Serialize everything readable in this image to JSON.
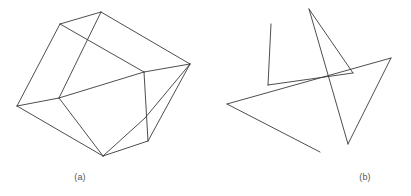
{
  "figure": {
    "background_color": "#ffffff",
    "stroke_color": "#3a3a3a",
    "caption_color": "#555555",
    "width": 411,
    "height": 196,
    "panels": [
      {
        "id": "a",
        "caption": "(a)",
        "description": "wireframe-box-open-cube",
        "origin_x": 0,
        "origin_y": 0,
        "vertices": {
          "outer_top": [
            101,
            12
          ],
          "outer_upper_left": [
            60,
            24
          ],
          "outer_left": [
            17,
            106
          ],
          "outer_bottom": [
            103,
            156
          ],
          "outer_lower_right": [
            148,
            141
          ],
          "outer_right": [
            190,
            64
          ],
          "inner_top_left": [
            58,
            43
          ],
          "inner_bottom_left": [
            59,
            98
          ],
          "inner_top_right": [
            144,
            72
          ],
          "inner_bottom_right": [
            145,
            118
          ]
        },
        "edges": [
          [
            [
              101,
              12
            ],
            [
              60,
              24
            ]
          ],
          [
            [
              60,
              24
            ],
            [
              17,
              106
            ]
          ],
          [
            [
              17,
              106
            ],
            [
              103,
              156
            ]
          ],
          [
            [
              103,
              156
            ],
            [
              148,
              141
            ]
          ],
          [
            [
              148,
              141
            ],
            [
              190,
              64
            ]
          ],
          [
            [
              190,
              64
            ],
            [
              101,
              12
            ]
          ],
          [
            [
              60,
              24
            ],
            [
              144,
              72
            ]
          ],
          [
            [
              101,
              12
            ],
            [
              59,
              98
            ]
          ],
          [
            [
              59,
              98
            ],
            [
              17,
              106
            ]
          ],
          [
            [
              59,
              98
            ],
            [
              103,
              156
            ]
          ],
          [
            [
              59,
              98
            ],
            [
              144,
              72
            ]
          ],
          [
            [
              144,
              72
            ],
            [
              190,
              64
            ]
          ],
          [
            [
              144,
              72
            ],
            [
              148,
              141
            ]
          ],
          [
            [
              103,
              156
            ],
            [
              145,
              118
            ]
          ],
          [
            [
              145,
              118
            ],
            [
              190,
              64
            ]
          ]
        ]
      },
      {
        "id": "b",
        "caption": "(b)",
        "description": "random-scattered-line-segments",
        "origin_x": 205,
        "origin_y": 0,
        "segments": [
          {
            "name": "vertical-left-stroke",
            "points": [
              [
                271,
                24
              ],
              [
                268,
                85
              ]
            ]
          },
          {
            "name": "narrow-v-left-stroke",
            "points": [
              [
                309,
                9
              ],
              [
                348,
                144
              ]
            ]
          },
          {
            "name": "narrow-v-right-stroke",
            "points": [
              [
                309,
                9
              ],
              [
                353,
                73
              ]
            ]
          },
          {
            "name": "long-shallow-stroke",
            "points": [
              [
                353,
                73
              ],
              [
                268,
                85
              ]
            ]
          },
          {
            "name": "triangle-upper-stroke",
            "points": [
              [
                391,
                58
              ],
              [
                227,
                104
              ]
            ]
          },
          {
            "name": "triangle-right-stroke",
            "points": [
              [
                391,
                58
              ],
              [
                348,
                144
              ]
            ]
          },
          {
            "name": "open-wedge-stroke",
            "points": [
              [
                227,
                104
              ],
              [
                320,
                152
              ]
            ]
          }
        ]
      }
    ]
  }
}
